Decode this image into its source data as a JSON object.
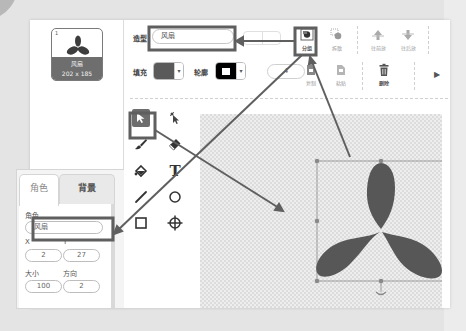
{
  "costume_list": {
    "items": [
      {
        "index": "1",
        "name": "风扇",
        "size": "202 x 185",
        "selected": true
      }
    ]
  },
  "costume_settings": {
    "costume_label": "造型",
    "costume_name": "风扇",
    "fill_label": "填充",
    "fill_color": "#5a5a5a",
    "outline_label": "轮廓",
    "outline_color": "#000000",
    "outline_width": "4"
  },
  "toolbar": {
    "group_label": "分组",
    "ungroup_label": "拆散",
    "forward_label": "往前放",
    "backward_label": "往后放",
    "copy_label": "复制",
    "paste_label": "粘贴",
    "delete_label": "删除"
  },
  "tools": [
    {
      "name": "select",
      "icon": "arrow-cursor-icon",
      "selected": true
    },
    {
      "name": "reshape",
      "icon": "reshape-cursor-icon"
    },
    {
      "name": "brush",
      "icon": "brush-icon"
    },
    {
      "name": "eraser",
      "icon": "eraser-icon"
    },
    {
      "name": "fill",
      "icon": "paint-bucket-icon"
    },
    {
      "name": "text",
      "icon": "text-icon",
      "glyph": "T"
    },
    {
      "name": "line",
      "icon": "line-icon"
    },
    {
      "name": "circle",
      "icon": "circle-icon"
    },
    {
      "name": "rectangle",
      "icon": "rectangle-icon"
    },
    {
      "name": "center",
      "icon": "crosshair-icon"
    }
  ],
  "sprite_panel": {
    "tabs": [
      {
        "label": "角色",
        "active": true
      },
      {
        "label": "背景",
        "active": false
      }
    ],
    "sprite_label": "角色",
    "sprite_name": "风扇",
    "x_label": "X",
    "x_value": "2",
    "y_label": "Y",
    "y_value": "27",
    "size_label": "大小",
    "size_value": "100",
    "direction_label": "方向",
    "direction_value": "2"
  },
  "canvas": {
    "shape": "fan-propeller",
    "shape_color": "#575757",
    "selection_color": "#8a8a8a"
  },
  "annotation": {
    "highlight_color": "#5f5f5f"
  }
}
